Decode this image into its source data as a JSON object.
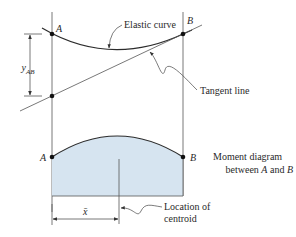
{
  "figure": {
    "upper": {
      "point_a_label": "A",
      "point_b_label": "B",
      "elastic_curve_label": "Elastic curve",
      "tangent_line_label": "Tangent line",
      "deviation_label_main": "y",
      "deviation_label_sub": "AB"
    },
    "lower": {
      "point_a_label": "A",
      "point_b_label": "B",
      "moment_diagram_line1": "Moment diagram",
      "moment_diagram_line2_prefix": "between ",
      "moment_diagram_line2_a": "A",
      "moment_diagram_line2_mid": " and ",
      "moment_diagram_line2_b": "B",
      "centroid_line1": "Location of",
      "centroid_line2": "centroid",
      "xbar_label": "x̄"
    },
    "colors": {
      "moment_fill": "#d6e4f0",
      "line": "#555555",
      "curve": "#2c2c2c"
    }
  }
}
